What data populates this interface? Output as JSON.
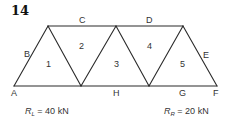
{
  "problem_number": "14",
  "truss": {
    "stroke_color": "#2a2a2a",
    "top_joints": [
      [
        48,
        26
      ],
      [
        116,
        26
      ],
      [
        183,
        26
      ]
    ],
    "bottom_joints": [
      [
        14,
        86
      ],
      [
        81,
        86
      ],
      [
        149,
        86
      ],
      [
        217,
        86
      ]
    ],
    "space_labels": {
      "A": "A",
      "B": "B",
      "C": "C",
      "D": "D",
      "E": "E",
      "F": "F",
      "G": "G",
      "H": "H"
    },
    "panel_numbers": [
      "1",
      "2",
      "3",
      "4",
      "5"
    ]
  },
  "reactions": {
    "left": {
      "symbol": "R",
      "subscript": "L",
      "value": "= 40 kN"
    },
    "right": {
      "symbol": "R",
      "subscript": "R",
      "value": "= 20 kN"
    }
  }
}
